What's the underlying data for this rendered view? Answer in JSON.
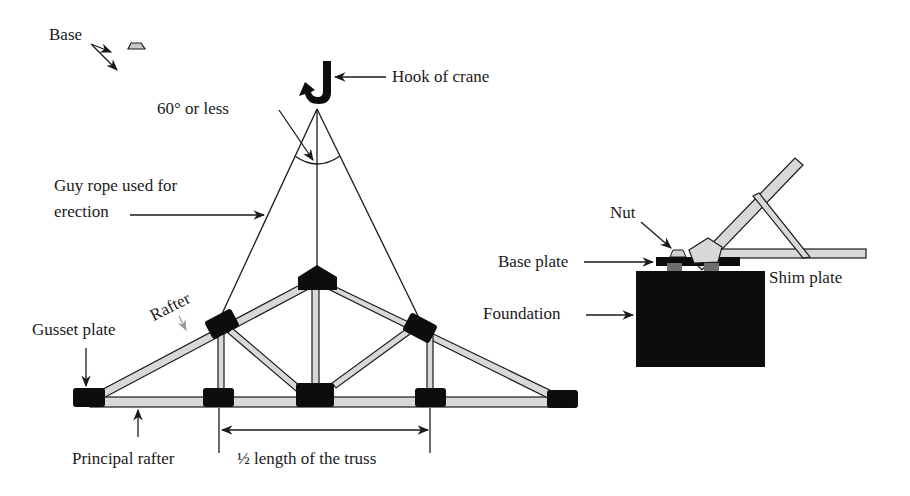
{
  "diagram": {
    "type": "roof-truss-erection",
    "labels": {
      "base": "Base",
      "hook": "Hook of crane",
      "angle": "60° or less",
      "guy_rope_line1": "Guy rope used for",
      "guy_rope_line2": "erection",
      "rafter": "Rafter",
      "gusset_plate": "Gusset plate",
      "principal_rafter": "Principal rafter",
      "half_length": "½ length of the truss",
      "nut": "Nut",
      "base_plate": "Base plate",
      "shim_plate": "Shim plate",
      "foundation": "Foundation"
    },
    "colors": {
      "member_fill": "#d8d8d8",
      "gusset": "#0d0d0d",
      "foundation": "#0d0d0d",
      "shim": "#6e6e6e",
      "line": "#1a1a1a"
    }
  }
}
